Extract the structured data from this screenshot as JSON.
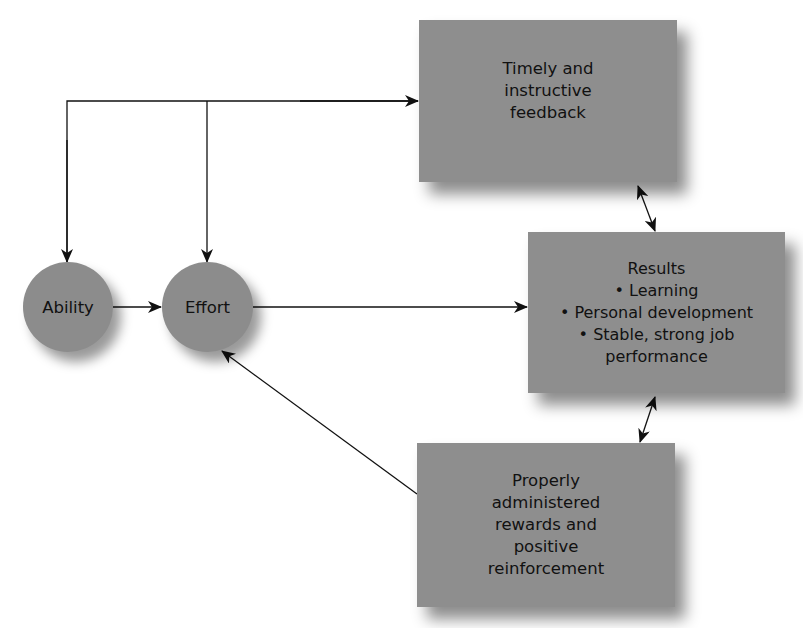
{
  "diagram": {
    "nodes": {
      "ability": {
        "label": "Ability"
      },
      "effort": {
        "label": "Effort"
      },
      "feedback": {
        "lines": [
          "Timely and",
          "instructive",
          "feedback"
        ]
      },
      "results": {
        "lines": [
          "Results",
          "• Learning",
          "• Personal development",
          "• Stable, strong job",
          "performance"
        ]
      },
      "rewards": {
        "lines": [
          "Properly",
          "administered",
          "rewards and",
          "positive",
          "reinforcement"
        ]
      }
    },
    "edges": [
      {
        "from": "feedback",
        "to": "ability"
      },
      {
        "from": "feedback",
        "to": "effort"
      },
      {
        "from": "ability",
        "to": "effort"
      },
      {
        "from": "effort",
        "to": "results"
      },
      {
        "from": "rewards",
        "to": "effort"
      },
      {
        "from": "feedback",
        "to": "results",
        "bidirectional": true
      },
      {
        "from": "rewards",
        "to": "results",
        "bidirectional": true
      }
    ],
    "colors": {
      "node_fill": "#8e8e8e",
      "line": "#111111",
      "background": "#ffffff"
    }
  }
}
